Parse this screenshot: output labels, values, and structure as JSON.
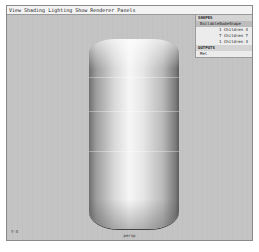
{
  "menubar": {
    "items": [
      "View",
      "Shading",
      "Lighting",
      "Show",
      "Renderer",
      "Panels"
    ]
  },
  "panel": {
    "shapes_header": "SHAPES",
    "selected_shape": "BoilableNodeShape",
    "rows": [
      "1 Children 4",
      "7 Children 7",
      "1 Children 4"
    ],
    "outputs_header": "OUTPUTS",
    "output_item": "Mel"
  },
  "viewport": {
    "axis_label": "Y-X",
    "camera_label": "persp"
  }
}
